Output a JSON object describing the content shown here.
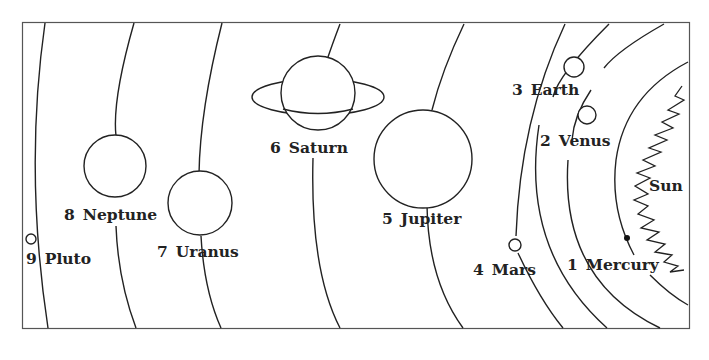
{
  "diagram": {
    "title": "",
    "type": "solar-system-orbits",
    "colors": {
      "line": "#222222",
      "frame": "#555555",
      "background": "#ffffff"
    },
    "sun": {
      "label": "Sun"
    },
    "planets": [
      {
        "number": "1",
        "name": "Mercury"
      },
      {
        "number": "2",
        "name": "Venus"
      },
      {
        "number": "3",
        "name": "Earth"
      },
      {
        "number": "4",
        "name": "Mars"
      },
      {
        "number": "5",
        "name": "Jupiter"
      },
      {
        "number": "6",
        "name": "Saturn"
      },
      {
        "number": "7",
        "name": "Uranus"
      },
      {
        "number": "8",
        "name": "Neptune"
      },
      {
        "number": "9",
        "name": "Pluto"
      }
    ]
  }
}
